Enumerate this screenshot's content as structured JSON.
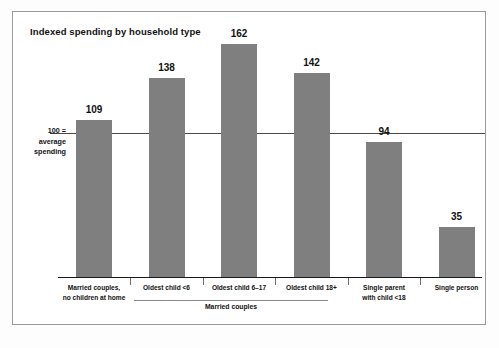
{
  "chart": {
    "title": "Indexed spending by household type",
    "axis_label_lines": [
      "100 =",
      "average",
      "spending"
    ],
    "group_label": "Married couples"
  },
  "chart_data": {
    "type": "bar",
    "title": "Indexed spending by household type",
    "xlabel": "",
    "ylabel": "100 = average spending",
    "ylim": [
      0,
      175
    ],
    "reference_line": 100,
    "grid": false,
    "legend": "none",
    "categories": [
      "Married couples, no children at home",
      "Oldest child <6",
      "Oldest child 6–17",
      "Oldest child 18+",
      "Single parent with child <18",
      "Single person"
    ],
    "category_lines": [
      [
        "Married couples,",
        "no children at home"
      ],
      [
        "Oldest child <6"
      ],
      [
        "Oldest child 6–17"
      ],
      [
        "Oldest child 18+"
      ],
      [
        "Single parent",
        "with child <18"
      ],
      [
        "Single person"
      ]
    ],
    "values": [
      109,
      138,
      162,
      142,
      94,
      35
    ],
    "value_labels": [
      "109",
      "138",
      "162",
      "142",
      "94",
      "35"
    ],
    "group_bracket": {
      "label": "Married couples",
      "spans": [
        "Oldest child <6",
        "Oldest child 6–17",
        "Oldest child 18+"
      ]
    },
    "bar_color": "#7f7f7f",
    "text_color": "#111111"
  }
}
